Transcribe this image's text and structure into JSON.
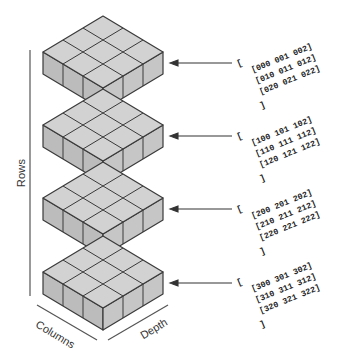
{
  "axes": {
    "rows_label": "Rows",
    "columns_label": "Columns",
    "depth_label": "Depth"
  },
  "colors": {
    "top_face": "#d2d2d2",
    "left_face": "#bcbcbc",
    "right_face": "#c6c6c6",
    "edge": "#3a3a3a"
  },
  "layers": [
    {
      "open": "[",
      "lines": [
        "[000 001 002]",
        "[010 011 012]",
        "[020 021 022]"
      ],
      "close": "]"
    },
    {
      "open": "[",
      "lines": [
        "[100 101 102]",
        "[110 111 112]",
        "[120 121 122]"
      ],
      "close": "]"
    },
    {
      "open": "[",
      "lines": [
        "[200 201 202]",
        "[210 211 212]",
        "[220 221 222]"
      ],
      "close": "]"
    },
    {
      "open": "[",
      "lines": [
        "[300 301 302]",
        "[310 311 312]",
        "[320 321 322]"
      ],
      "close": "]"
    }
  ]
}
